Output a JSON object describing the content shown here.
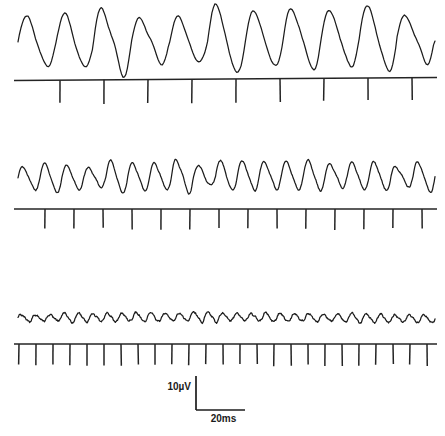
{
  "figure": {
    "background_color": "#ffffff",
    "trace_color": "#1c1c1c",
    "marker_color": "#242424"
  },
  "scale_bar": {
    "name": "calibration-scale-bar",
    "vertical_label": "10µV",
    "horizontal_label": "20ms",
    "vertical_value": 10,
    "vertical_unit": "µV",
    "horizontal_value": 20,
    "horizontal_unit": "ms",
    "corner_x": 196,
    "top_y": 376,
    "bottom_y": 410,
    "right_x": 245
  },
  "chart_data": {
    "type": "line",
    "xlabel": "Time",
    "ylabel": "Amplitude",
    "grid": false,
    "legend": "none",
    "x_unit": "ms",
    "y_unit": "µV",
    "x_range_px": [
      18,
      435
    ],
    "scale": {
      "vertical_bar_microvolts": 10,
      "vertical_bar_pixels": 34,
      "horizontal_bar_milliseconds": 20,
      "horizontal_bar_pixels": 49
    },
    "panels": [
      {
        "id": "panel-1",
        "name": "slow-rate-panel",
        "trace_name": "trace-slow-large-amplitude",
        "baseline_y": 40,
        "amplitude_px": 29,
        "cycles": 11,
        "stimulus_count": 9,
        "stimulus_interval_px": 44,
        "stimulus_first_x": 60,
        "marker_baseline_y": 79,
        "marker_tick_length": 23,
        "description": "Low-frequency stimulation evokes large-amplitude oscillatory response"
      },
      {
        "id": "panel-2",
        "name": "medium-rate-panel",
        "trace_name": "trace-medium-amplitude",
        "baseline_y": 177,
        "amplitude_px": 13,
        "cycles": 19,
        "stimulus_count": 14,
        "stimulus_interval_px": 29,
        "stimulus_first_x": 45,
        "marker_baseline_y": 209,
        "marker_tick_length": 20,
        "description": "Medium-frequency stimulation evokes reduced-amplitude oscillatory response"
      },
      {
        "id": "panel-3",
        "name": "fast-rate-panel",
        "trace_name": "trace-fast-small-amplitude",
        "baseline_y": 318,
        "amplitude_px": 4,
        "cycles": 29,
        "stimulus_count": 25,
        "stimulus_interval_px": 17,
        "stimulus_first_x": 19,
        "marker_baseline_y": 344,
        "marker_tick_length": 21,
        "description": "High-frequency stimulation evokes minimal-amplitude response"
      }
    ]
  }
}
